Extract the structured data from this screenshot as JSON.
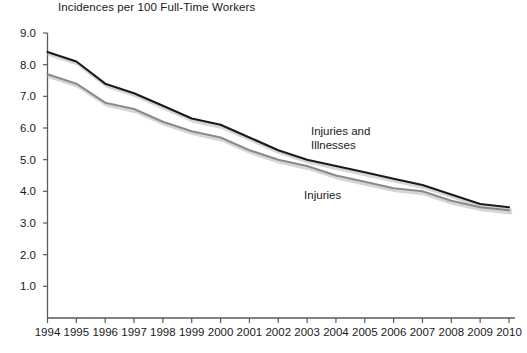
{
  "chart_data": {
    "type": "line",
    "title": "Incidences per 100 Full-Time Workers",
    "xlabel": "",
    "ylabel": "",
    "ylim": [
      0.0,
      9.0
    ],
    "ytick_step": 1.0,
    "grid": false,
    "legend_position": "inline-annotation",
    "categories": [
      "1994",
      "1995",
      "1996",
      "1997",
      "1998",
      "1999",
      "2000",
      "2001",
      "2002",
      "2003",
      "2004",
      "2005",
      "2006",
      "2007",
      "2008",
      "2009",
      "2010"
    ],
    "ytick_labels": [
      "9.0",
      "8.0",
      "7.0",
      "6.0",
      "5.0",
      "4.0",
      "3.0",
      "2.0",
      "1.0"
    ],
    "series": [
      {
        "name": "Injuries and Illnesses",
        "color": "#1a1a1a",
        "values": [
          8.4,
          8.1,
          7.4,
          7.1,
          6.7,
          6.3,
          6.1,
          5.7,
          5.3,
          5.0,
          4.8,
          4.6,
          4.4,
          4.2,
          3.9,
          3.6,
          3.5
        ]
      },
      {
        "name": "Injuries",
        "color": "#8a8a8a",
        "values": [
          7.7,
          7.4,
          6.8,
          6.6,
          6.2,
          5.9,
          5.7,
          5.3,
          5.0,
          4.8,
          4.5,
          4.3,
          4.1,
          4.0,
          3.7,
          3.5,
          3.4
        ]
      }
    ],
    "annotations": [
      {
        "text": "Injuries and\nIllnesses",
        "series": "Injuries and Illnesses"
      },
      {
        "text": "Injuries",
        "series": "Injuries"
      }
    ]
  },
  "colors": {
    "background": "#ffffff",
    "axis": "#5a5a5a",
    "text": "#1a1a1a",
    "series_dark": "#1a1a1a",
    "series_gray": "#8a8a8a",
    "shadow": "#c8c8c8"
  },
  "annotation_labels": {
    "injuries_illnesses": "Injuries and\nIllnesses",
    "injuries": "Injuries"
  }
}
